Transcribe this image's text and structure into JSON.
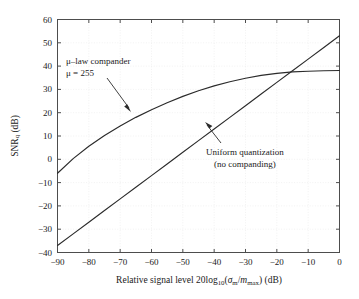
{
  "figure": {
    "background": "#ffffff",
    "line_color": "#2b2b2b",
    "axis_color": "#4d4d4d",
    "grid_color": "#ededed"
  },
  "axes": {
    "x": {
      "label_text": "Relative signal level 20log10(σm/mmax) (dB)",
      "min": -90,
      "max": 0,
      "ticks": [
        -90,
        -80,
        -70,
        -60,
        -50,
        -40,
        -30,
        -20,
        -10,
        0
      ],
      "tick_labels": [
        "−90",
        "−80",
        "−70",
        "−60",
        "−50",
        "−40",
        "−30",
        "−20",
        "−10",
        "0"
      ]
    },
    "y": {
      "label_text": "SNRq (dB)",
      "min": -40,
      "max": 60,
      "ticks": [
        -40,
        -30,
        -20,
        -10,
        0,
        10,
        20,
        30,
        40,
        50,
        60
      ],
      "tick_labels": [
        "−40",
        "−30",
        "−20",
        "−10",
        "0",
        "10",
        "20",
        "30",
        "40",
        "50",
        "60"
      ]
    }
  },
  "annotations": {
    "mu_law": {
      "line1": "μ–law compander",
      "line2": "μ = 255"
    },
    "uniform": {
      "line1": "Uniform quantization",
      "line2": "(no companding)"
    }
  },
  "chart_data": {
    "type": "line",
    "title": "",
    "xlabel": "Relative signal level 20log10(σm/mmax) (dB)",
    "ylabel": "SNRq (dB)",
    "xlim": [
      -90,
      0
    ],
    "ylim": [
      -40,
      60
    ],
    "grid": true,
    "legend": "annotations-inline",
    "x": [
      -90,
      -85,
      -80,
      -75,
      -70,
      -65,
      -60,
      -55,
      -50,
      -45,
      -40,
      -35,
      -30,
      -25,
      -20,
      -15,
      -10,
      -5,
      0
    ],
    "series": [
      {
        "name": "μ-law compander, μ = 255",
        "values": [
          -6.0,
          0.3,
          5.6,
          10.2,
          14.3,
          18.0,
          21.3,
          24.3,
          27.0,
          29.4,
          31.5,
          33.3,
          34.8,
          36.0,
          36.9,
          37.5,
          37.8,
          38.0,
          38.1
        ]
      },
      {
        "name": "Uniform quantization (no companding)",
        "values": [
          -37.0,
          -32.0,
          -27.0,
          -22.0,
          -17.0,
          -12.0,
          -7.0,
          -2.0,
          3.0,
          8.0,
          13.0,
          18.0,
          23.0,
          28.0,
          33.0,
          38.0,
          43.0,
          48.0,
          53.0
        ]
      }
    ],
    "crossing_point": {
      "x": -15,
      "y": 38
    }
  }
}
